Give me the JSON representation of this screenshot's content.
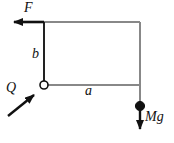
{
  "figure": {
    "type": "mechanics-free-body-diagram",
    "background_color": "#ffffff",
    "frame_color": "#888888",
    "ink_color": "#111111",
    "width": 174,
    "height": 143
  },
  "labels": {
    "force_F": "F",
    "dimension_b": "b",
    "dimension_a": "a",
    "force_Q": "Q",
    "weight_Mg": "Mg"
  },
  "geometry": {
    "corner_top_left": [
      44,
      22
    ],
    "corner_top_right": [
      140,
      22
    ],
    "pivot": [
      44,
      85
    ],
    "corner_bottom_right": [
      140,
      85
    ],
    "mass_center": [
      140,
      106
    ],
    "mass_radius": 4.5,
    "pivot_radius": 4,
    "force_F_arrow": {
      "from": [
        44,
        22
      ],
      "to": [
        8,
        22
      ],
      "direction": "left"
    },
    "force_Q_arrow": {
      "from": [
        8,
        115
      ],
      "to": [
        39,
        90
      ],
      "direction": "up-right"
    },
    "weight_Mg_arrow": {
      "from": [
        140,
        106
      ],
      "to": [
        140,
        137
      ],
      "direction": "down"
    }
  },
  "icons": {
    "pivot": "hollow-circle-pivot-icon",
    "mass": "filled-circle-mass-icon",
    "arrow_f": "left-arrow-icon",
    "arrow_q": "diagonal-up-right-arrow-icon",
    "arrow_mg": "down-arrow-icon"
  }
}
